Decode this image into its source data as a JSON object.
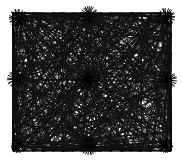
{
  "figure": {
    "title": "Dense straight-line mesh diagram",
    "type": "line-art-diagram",
    "canvas": {
      "width": 182,
      "height": 160,
      "background": "#ffffff"
    },
    "plot_area": {
      "x": 13,
      "y": 13,
      "width": 158,
      "height": 138
    },
    "colors": {
      "background": "#ffffff",
      "grid": "#9a9a9a",
      "chord": "#111111",
      "border": "#000000",
      "hub": "#000000"
    },
    "grid": {
      "visible": true,
      "columns": 16,
      "rows": 14,
      "stroke_width": 0.45,
      "color": "#9a9a9a"
    },
    "border": {
      "visible": true,
      "stroke_width": 1.1,
      "color": "#000000"
    },
    "chords": {
      "stroke_width": 0.85,
      "color": "#111111",
      "perimeter_nodes_top": 17,
      "perimeter_nodes_bottom": 17,
      "perimeter_nodes_left": 15,
      "perimeter_nodes_right": 15,
      "total_estimate": 320
    },
    "hubs": [
      {
        "name": "top-left-corner",
        "x": 18,
        "y": 18,
        "rays": 26,
        "intensity": "high"
      },
      {
        "name": "top-center",
        "x": 89,
        "y": 15,
        "rays": 28,
        "intensity": "high"
      },
      {
        "name": "top-right-corner",
        "x": 166,
        "y": 17,
        "rays": 26,
        "intensity": "high"
      },
      {
        "name": "left-middle",
        "x": 16,
        "y": 79,
        "rays": 24,
        "intensity": "high"
      },
      {
        "name": "center",
        "x": 89,
        "y": 79,
        "rays": 34,
        "intensity": "very-high"
      },
      {
        "name": "right-middle",
        "x": 168,
        "y": 80,
        "rays": 24,
        "intensity": "high"
      },
      {
        "name": "bottom-left-corner",
        "x": 18,
        "y": 146,
        "rays": 24,
        "intensity": "medium"
      },
      {
        "name": "bottom-center",
        "x": 89,
        "y": 146,
        "rays": 28,
        "intensity": "high"
      },
      {
        "name": "bottom-right-corner",
        "x": 166,
        "y": 146,
        "rays": 24,
        "intensity": "medium"
      }
    ],
    "labels": {
      "has_text": false,
      "axis_labels": [],
      "legend_entries": [],
      "tick_labels": []
    }
  }
}
